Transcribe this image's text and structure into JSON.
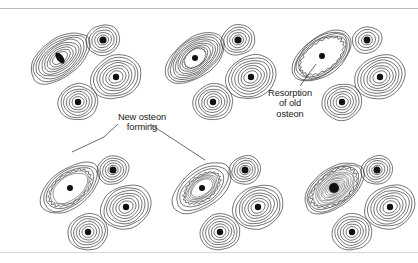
{
  "figure": {
    "line_color": "#1a1a1a",
    "canal_color": "#111111",
    "background": "#ffffff",
    "rules": {
      "top_color": "#b9b9b9",
      "bottom_color": "#d8d8d8"
    }
  },
  "labels": [
    {
      "name": "new-osteon-forming",
      "text": "New osteon\nforming",
      "lines": [
        "New osteon",
        "forming"
      ]
    },
    {
      "name": "resorption-of-old-osteon",
      "text": "Resorption\nof old\nosteon",
      "lines": [
        "Resorption",
        "of old",
        "osteon"
      ]
    }
  ],
  "panels": [
    {
      "id": "panel-1",
      "stage": "intact-osteon",
      "origin": [
        8,
        10
      ],
      "osteons": [
        {
          "name": "primary-osteon",
          "cx": 52,
          "cy": 48,
          "rx": 34,
          "ry": 19,
          "rot": -37,
          "rings": 9,
          "canal": {
            "rx": 3.2,
            "ry": 6.5,
            "rot": -37
          },
          "state": "intact"
        },
        {
          "name": "satellite-osteon-upper-right",
          "cx": 95,
          "cy": 30,
          "rx": 17,
          "ry": 15,
          "rot": -20,
          "rings": 5,
          "canal": {
            "rx": 3.6,
            "ry": 3.6,
            "rot": 0
          },
          "state": "intact"
        },
        {
          "name": "satellite-osteon-right",
          "cx": 108,
          "cy": 67,
          "rx": 26,
          "ry": 21,
          "rot": -25,
          "rings": 7,
          "canal": {
            "rx": 3.2,
            "ry": 3.2,
            "rot": 0
          },
          "state": "intact"
        },
        {
          "name": "satellite-osteon-lower",
          "cx": 70,
          "cy": 92,
          "rx": 20,
          "ry": 18,
          "rot": -15,
          "rings": 6,
          "canal": {
            "rx": 3.2,
            "ry": 3.2,
            "rot": 0
          },
          "state": "intact"
        }
      ]
    },
    {
      "id": "panel-2",
      "stage": "resorption-beginning",
      "origin": [
        143,
        10
      ],
      "osteons": [
        {
          "name": "primary-osteon",
          "cx": 52,
          "cy": 48,
          "rx": 34,
          "ry": 19,
          "rot": -37,
          "rings": 8,
          "canal": {
            "rx": 3.0,
            "ry": 3.0,
            "rot": 0
          },
          "state": "resorbing-early",
          "cavity": {
            "rx": 12,
            "ry": 8,
            "rot": -37
          }
        },
        {
          "name": "satellite-osteon-upper-right",
          "cx": 95,
          "cy": 30,
          "rx": 17,
          "ry": 15,
          "rot": -20,
          "rings": 5,
          "canal": {
            "rx": 3.6,
            "ry": 3.6,
            "rot": 0
          },
          "state": "intact"
        },
        {
          "name": "satellite-osteon-right",
          "cx": 108,
          "cy": 67,
          "rx": 26,
          "ry": 21,
          "rot": -25,
          "rings": 7,
          "canal": {
            "rx": 3.2,
            "ry": 3.2,
            "rot": 0
          },
          "state": "intact"
        },
        {
          "name": "satellite-osteon-lower",
          "cx": 70,
          "cy": 92,
          "rx": 20,
          "ry": 18,
          "rot": -15,
          "rings": 6,
          "canal": {
            "rx": 3.2,
            "ry": 3.2,
            "rot": 0
          },
          "state": "intact"
        }
      ]
    },
    {
      "id": "panel-3",
      "stage": "resorption-cavity",
      "origin": [
        272,
        10
      ],
      "osteons": [
        {
          "name": "primary-osteon",
          "cx": 50,
          "cy": 46,
          "rx": 34,
          "ry": 19,
          "rot": -37,
          "rings": 4,
          "canal": {
            "rx": 3.0,
            "ry": 3.0,
            "rot": 0
          },
          "state": "resorbed",
          "cavity": {
            "rx": 25,
            "ry": 14,
            "rot": -37
          }
        },
        {
          "name": "satellite-osteon-upper-right",
          "cx": 95,
          "cy": 30,
          "rx": 15,
          "ry": 13,
          "rot": -20,
          "rings": 4,
          "canal": {
            "rx": 3.4,
            "ry": 3.4,
            "rot": 0
          },
          "state": "intact"
        },
        {
          "name": "satellite-osteon-right",
          "cx": 108,
          "cy": 67,
          "rx": 26,
          "ry": 21,
          "rot": -25,
          "rings": 7,
          "canal": {
            "rx": 3.2,
            "ry": 3.2,
            "rot": 0
          },
          "state": "intact"
        },
        {
          "name": "satellite-osteon-lower",
          "cx": 70,
          "cy": 92,
          "rx": 20,
          "ry": 18,
          "rot": -15,
          "rings": 6,
          "canal": {
            "rx": 3.2,
            "ry": 3.2,
            "rot": 0
          },
          "state": "intact"
        }
      ]
    },
    {
      "id": "panel-4",
      "stage": "new-lamellae-thin",
      "origin": [
        18,
        140
      ],
      "osteons": [
        {
          "name": "primary-osteon",
          "cx": 52,
          "cy": 48,
          "rx": 34,
          "ry": 19,
          "rot": -37,
          "rings": 3,
          "canal": {
            "rx": 3.0,
            "ry": 3.0,
            "rot": 0
          },
          "state": "reforming",
          "cavity": {
            "rx": 24,
            "ry": 14,
            "rot": -37
          },
          "new_lamellae": 2
        },
        {
          "name": "satellite-osteon-upper-right",
          "cx": 95,
          "cy": 30,
          "rx": 16,
          "ry": 14,
          "rot": -20,
          "rings": 5,
          "canal": {
            "rx": 3.5,
            "ry": 3.5,
            "rot": 0
          },
          "state": "intact"
        },
        {
          "name": "satellite-osteon-right",
          "cx": 108,
          "cy": 67,
          "rx": 26,
          "ry": 21,
          "rot": -25,
          "rings": 7,
          "canal": {
            "rx": 3.2,
            "ry": 3.2,
            "rot": 0
          },
          "state": "intact"
        },
        {
          "name": "satellite-osteon-lower",
          "cx": 70,
          "cy": 92,
          "rx": 20,
          "ry": 18,
          "rot": -15,
          "rings": 6,
          "canal": {
            "rx": 3.2,
            "ry": 3.2,
            "rot": 0
          },
          "state": "intact"
        }
      ]
    },
    {
      "id": "panel-5",
      "stage": "new-lamellae-thick",
      "origin": [
        150,
        140
      ],
      "osteons": [
        {
          "name": "primary-osteon",
          "cx": 52,
          "cy": 48,
          "rx": 34,
          "ry": 19,
          "rot": -37,
          "rings": 3,
          "canal": {
            "rx": 3.0,
            "ry": 3.0,
            "rot": 0
          },
          "state": "reforming",
          "cavity": {
            "rx": 21,
            "ry": 12,
            "rot": -37
          },
          "new_lamellae": 5
        },
        {
          "name": "satellite-osteon-upper-right",
          "cx": 95,
          "cy": 30,
          "rx": 16,
          "ry": 14,
          "rot": -20,
          "rings": 5,
          "canal": {
            "rx": 3.5,
            "ry": 3.5,
            "rot": 0
          },
          "state": "intact"
        },
        {
          "name": "satellite-osteon-right",
          "cx": 108,
          "cy": 67,
          "rx": 26,
          "ry": 21,
          "rot": -25,
          "rings": 7,
          "canal": {
            "rx": 3.2,
            "ry": 3.2,
            "rot": 0
          },
          "state": "intact"
        },
        {
          "name": "satellite-osteon-lower",
          "cx": 70,
          "cy": 92,
          "rx": 20,
          "ry": 18,
          "rot": -15,
          "rings": 6,
          "canal": {
            "rx": 3.2,
            "ry": 3.2,
            "rot": 0
          },
          "state": "intact"
        }
      ]
    },
    {
      "id": "panel-6",
      "stage": "new-osteon-complete",
      "origin": [
        282,
        140
      ],
      "osteons": [
        {
          "name": "primary-osteon",
          "cx": 52,
          "cy": 48,
          "rx": 34,
          "ry": 19,
          "rot": -37,
          "rings": 3,
          "canal": {
            "rx": 5.0,
            "ry": 5.0,
            "rot": 0
          },
          "state": "complete",
          "cavity": {
            "rx": 26,
            "ry": 15,
            "rot": -37
          },
          "new_lamellae": 11
        },
        {
          "name": "satellite-osteon-upper-right",
          "cx": 95,
          "cy": 30,
          "rx": 16,
          "ry": 14,
          "rot": -20,
          "rings": 5,
          "canal": {
            "rx": 3.5,
            "ry": 3.5,
            "rot": 0
          },
          "state": "intact"
        },
        {
          "name": "satellite-osteon-right",
          "cx": 108,
          "cy": 67,
          "rx": 26,
          "ry": 21,
          "rot": -25,
          "rings": 7,
          "canal": {
            "rx": 3.2,
            "ry": 3.2,
            "rot": 0
          },
          "state": "intact"
        },
        {
          "name": "satellite-osteon-lower",
          "cx": 70,
          "cy": 92,
          "rx": 20,
          "ry": 18,
          "rot": -15,
          "rings": 6,
          "canal": {
            "rx": 3.2,
            "ry": 3.2,
            "rot": 0
          },
          "state": "intact"
        }
      ]
    }
  ],
  "leaders": [
    {
      "name": "leader-new-osteon-left",
      "points": [
        [
          118,
          124
        ],
        [
          104,
          137
        ],
        [
          72,
          152
        ]
      ]
    },
    {
      "name": "leader-new-osteon-right",
      "points": [
        [
          150,
          124
        ],
        [
          205,
          160
        ]
      ]
    },
    {
      "name": "leader-resorption",
      "points": [
        [
          300,
          86
        ],
        [
          316,
          64
        ]
      ]
    }
  ]
}
